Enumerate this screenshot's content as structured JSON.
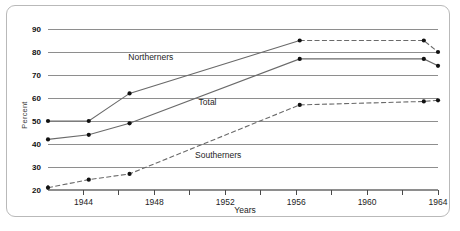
{
  "chart_data": {
    "type": "line",
    "title": "",
    "xlabel": "Years",
    "ylabel": "Percent",
    "xlim": [
      1942,
      1964
    ],
    "ylim": [
      20,
      90
    ],
    "grid": true,
    "legend_position": "inline-labels",
    "x_ticks": [
      1944,
      1946,
      1948,
      1950,
      1952,
      1954,
      1956,
      1958,
      1960,
      1962,
      1964
    ],
    "x_tick_labels": [
      "1944",
      "",
      "1948",
      "",
      "1952",
      "",
      "1956",
      "",
      "1960",
      "",
      "1964"
    ],
    "y_ticks": [
      20,
      30,
      40,
      50,
      60,
      70,
      80,
      90
    ],
    "y_tick_labels": [
      "20",
      "30",
      "40",
      "50",
      "60",
      "70",
      "80",
      "90"
    ],
    "series": [
      {
        "name": "Northerners",
        "style": "solid-then-dashed",
        "x": [
          1942,
          1944.3,
          1946.6,
          1956.2,
          1963.2,
          1964
        ],
        "values": [
          50,
          50,
          62,
          85,
          85,
          80
        ]
      },
      {
        "name": "Total",
        "style": "solid",
        "x": [
          1942,
          1944.3,
          1946.6,
          1956.2,
          1963.2,
          1964
        ],
        "values": [
          42,
          44,
          49,
          77,
          77,
          74
        ]
      },
      {
        "name": "Southerners",
        "style": "dashed",
        "x": [
          1942,
          1944.3,
          1946.6,
          1956.2,
          1963.2,
          1964
        ],
        "values": [
          21,
          24.5,
          27,
          57,
          58.5,
          59
        ]
      }
    ],
    "series_label_positions": [
      {
        "name": "Northerners",
        "x": 1947.8,
        "y": 76.5
      },
      {
        "name": "Total",
        "x": 1951.0,
        "y": 57.0
      },
      {
        "name": "Southerners",
        "x": 1951.6,
        "y": 34.0
      }
    ],
    "colors": {
      "line": "#6a6a6a",
      "marker": "#111111",
      "grid": "#8e8e8e",
      "text": "#1d1d1d",
      "frame": "#b9b9b9",
      "background": "#ffffff"
    }
  }
}
